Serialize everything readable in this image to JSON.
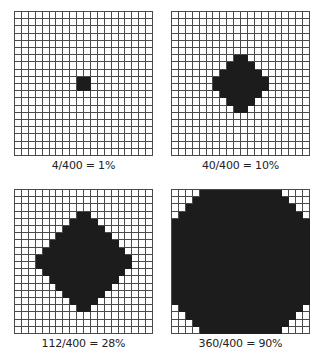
{
  "diagram": {
    "grid_size": 20,
    "colors": {
      "filled": "#1c1c1c",
      "empty": "#ffffff",
      "gridline": "#4a4a4a"
    },
    "panels": [
      {
        "label": "4/400 = 1%",
        "filled": 4,
        "total": 400,
        "percent": 1,
        "shape": "square",
        "rows": [
          [
            9,
            10
          ],
          [
            10,
            10
          ]
        ]
      },
      {
        "label": "40/400 = 10%",
        "filled": 40,
        "total": 400,
        "percent": 10,
        "shape": "diamond",
        "row_widths": [
          2,
          4,
          6,
          8,
          8,
          6,
          4,
          2
        ],
        "start_row": 6
      },
      {
        "label": "112/400 = 28%",
        "filled": 112,
        "total": 400,
        "percent": 28,
        "shape": "diamond",
        "row_widths": [
          2,
          4,
          6,
          8,
          10,
          12,
          14,
          14,
          12,
          10,
          8,
          6,
          4,
          2
        ],
        "start_row": 3
      },
      {
        "label": "360/400 = 90%",
        "filled": 360,
        "total": 400,
        "percent": 90,
        "shape": "rounded-square",
        "corner_cut": [
          4,
          3,
          2,
          1
        ]
      }
    ]
  }
}
